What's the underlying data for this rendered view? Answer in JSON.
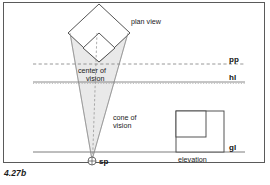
{
  "figure": {
    "caption": "4.27b",
    "frame_color": "#5a5a5a",
    "background": "#ffffff"
  },
  "labels": {
    "plan_view": "plan view",
    "center_of_vision_line1": "center of",
    "center_of_vision_line2": "vision",
    "cone_of_vision_line1": "cone of",
    "cone_of_vision_line2": "vision",
    "picture_plane": "pp",
    "horizon_line": "hl",
    "ground_line": "gl",
    "station_point": "sp",
    "elevation": "elevation"
  },
  "colors": {
    "line": "#4a4a4a",
    "cone_fill": "#e9e9e9",
    "cone_stroke": "#8a8a8a",
    "dashed_line": "#7a7a7a",
    "text": "#1a1a1a"
  },
  "geometry": {
    "plan_view_diamond": {
      "top": [
        99,
        4
      ],
      "right": [
        130,
        33
      ],
      "bottom": [
        99,
        62
      ],
      "left": [
        68,
        33
      ]
    },
    "plan_view_inner_square": {
      "top": [
        99,
        33
      ],
      "right": [
        115,
        48
      ],
      "bottom": [
        99,
        62
      ],
      "left": [
        83,
        48
      ]
    },
    "cone_of_vision": {
      "apex": [
        92,
        160
      ],
      "left_top": [
        70,
        33
      ],
      "right_top": [
        128,
        33
      ]
    },
    "station_point_marker": {
      "cx": 92,
      "cy": 161,
      "r": 4
    },
    "picture_plane_y": 64,
    "horizon_line_y": 82,
    "ground_line_y": 152,
    "center_axis_x": 97,
    "elevation_square": {
      "x": 176,
      "y": 111,
      "w": 48,
      "h": 41
    },
    "elevation_inner_square": {
      "x": 176,
      "y": 111,
      "w": 30,
      "h": 26
    }
  }
}
